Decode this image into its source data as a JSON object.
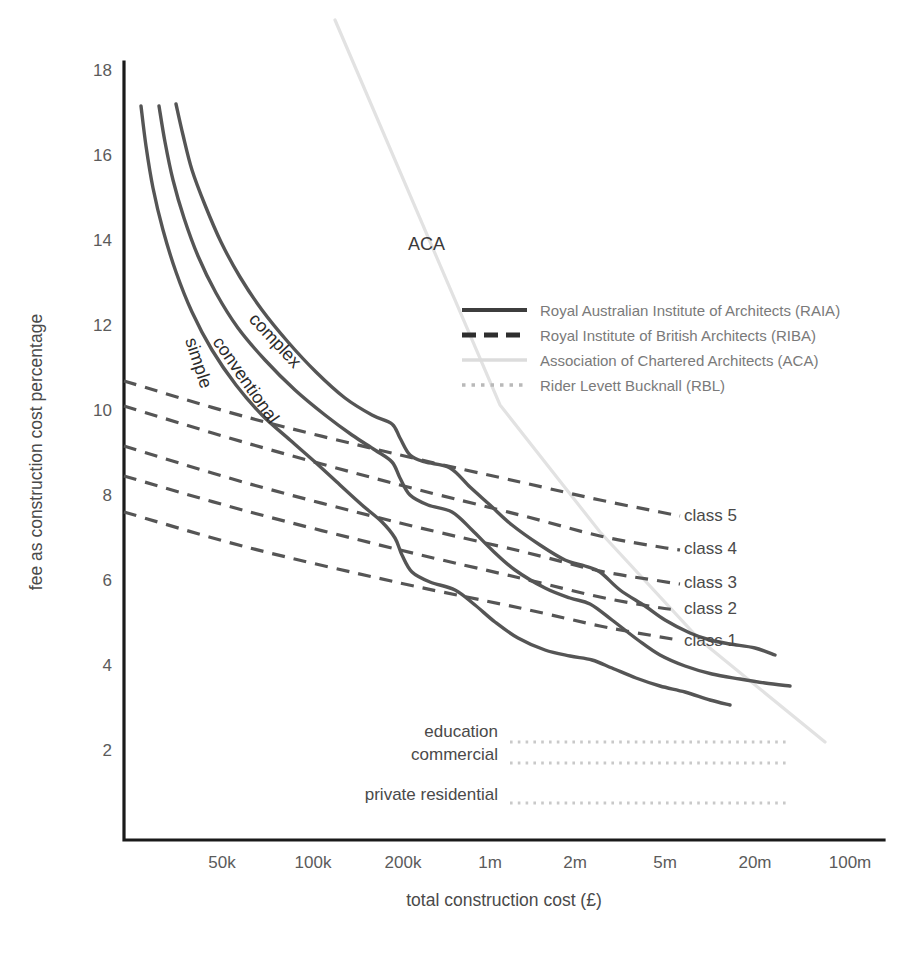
{
  "chart_data": {
    "type": "line",
    "title": "",
    "xlabel": "total construction cost (£)",
    "ylabel": "fee as construction cost percentage",
    "xscale": "log",
    "grid": false,
    "legend_position": "upper-right-inside",
    "xticks": [
      "50k",
      "100k",
      "200k",
      "1m",
      "2m",
      "5m",
      "20m",
      "100m"
    ],
    "xtick_values": [
      50000,
      100000,
      200000,
      1000000,
      2000000,
      5000000,
      20000000,
      100000000
    ],
    "xtick_px": [
      222,
      313,
      403,
      490,
      575,
      665,
      755,
      850
    ],
    "yticks": [
      2,
      4,
      6,
      8,
      10,
      12,
      14,
      16,
      18
    ],
    "ylim": [
      1.1,
      18.5
    ],
    "series": [
      {
        "name": "complex",
        "group": "RAIA",
        "style": "solid",
        "label": "complex",
        "label_px": {
          "x": 248,
          "y": 320,
          "rotate": 47
        },
        "points_px": [
          [
            176,
            104
          ],
          [
            183,
            135
          ],
          [
            192,
            170
          ],
          [
            205,
            205
          ],
          [
            221,
            242
          ],
          [
            240,
            277
          ],
          [
            262,
            310
          ],
          [
            288,
            342
          ],
          [
            316,
            372
          ],
          [
            345,
            398
          ],
          [
            372,
            415
          ],
          [
            392,
            424
          ],
          [
            400,
            438
          ],
          [
            410,
            455
          ],
          [
            425,
            462
          ],
          [
            450,
            468
          ],
          [
            470,
            487
          ],
          [
            490,
            505
          ],
          [
            512,
            525
          ],
          [
            540,
            545
          ],
          [
            565,
            560
          ],
          [
            585,
            566
          ],
          [
            600,
            572
          ],
          [
            620,
            590
          ],
          [
            645,
            606
          ],
          [
            665,
            620
          ],
          [
            690,
            633
          ],
          [
            710,
            640
          ],
          [
            730,
            644
          ],
          [
            755,
            648
          ],
          [
            775,
            655
          ]
        ]
      },
      {
        "name": "conventional",
        "group": "RAIA",
        "style": "solid",
        "label": "conventional",
        "label_px": {
          "x": 212,
          "y": 342,
          "rotate": 55
        },
        "points_px": [
          [
            159,
            106
          ],
          [
            165,
            142
          ],
          [
            173,
            180
          ],
          [
            184,
            218
          ],
          [
            198,
            256
          ],
          [
            216,
            293
          ],
          [
            238,
            328
          ],
          [
            265,
            360
          ],
          [
            295,
            390
          ],
          [
            325,
            415
          ],
          [
            352,
            435
          ],
          [
            375,
            450
          ],
          [
            392,
            462
          ],
          [
            400,
            478
          ],
          [
            410,
            495
          ],
          [
            428,
            505
          ],
          [
            452,
            512
          ],
          [
            472,
            530
          ],
          [
            492,
            550
          ],
          [
            515,
            570
          ],
          [
            545,
            588
          ],
          [
            570,
            598
          ],
          [
            590,
            604
          ],
          [
            612,
            620
          ],
          [
            638,
            640
          ],
          [
            660,
            655
          ],
          [
            685,
            666
          ],
          [
            712,
            674
          ],
          [
            740,
            679
          ],
          [
            765,
            683
          ],
          [
            790,
            686
          ]
        ]
      },
      {
        "name": "simple",
        "group": "RAIA",
        "style": "solid",
        "label": "simple",
        "label_px": {
          "x": 185,
          "y": 340,
          "rotate": 72
        },
        "points_px": [
          [
            141,
            106
          ],
          [
            146,
            146
          ],
          [
            153,
            188
          ],
          [
            163,
            230
          ],
          [
            176,
            272
          ],
          [
            192,
            312
          ],
          [
            212,
            350
          ],
          [
            236,
            385
          ],
          [
            262,
            415
          ],
          [
            290,
            440
          ],
          [
            315,
            462
          ],
          [
            340,
            485
          ],
          [
            362,
            505
          ],
          [
            382,
            522
          ],
          [
            395,
            538
          ],
          [
            402,
            555
          ],
          [
            412,
            572
          ],
          [
            430,
            582
          ],
          [
            455,
            590
          ],
          [
            475,
            605
          ],
          [
            495,
            622
          ],
          [
            518,
            638
          ],
          [
            545,
            650
          ],
          [
            570,
            656
          ],
          [
            592,
            660
          ],
          [
            612,
            668
          ],
          [
            636,
            678
          ],
          [
            660,
            686
          ],
          [
            685,
            692
          ],
          [
            710,
            700
          ],
          [
            730,
            705
          ]
        ]
      },
      {
        "name": "class 5",
        "group": "RIBA",
        "style": "dashed",
        "label": "class 5",
        "label_px": {
          "x": 684,
          "y": 521
        },
        "points_px": [
          [
            124,
            381
          ],
          [
            250,
            418
          ],
          [
            400,
            455
          ],
          [
            520,
            482
          ],
          [
            600,
            500
          ],
          [
            660,
            512
          ],
          [
            680,
            516
          ]
        ]
      },
      {
        "name": "class 4",
        "group": "RIBA",
        "style": "dashed",
        "label": "class 4",
        "label_px": {
          "x": 684,
          "y": 554
        },
        "points_px": [
          [
            124,
            406
          ],
          [
            250,
            444
          ],
          [
            400,
            485
          ],
          [
            520,
            515
          ],
          [
            600,
            536
          ],
          [
            660,
            547
          ],
          [
            680,
            550
          ]
        ]
      },
      {
        "name": "class 3",
        "group": "RIBA",
        "style": "dashed",
        "label": "class 3",
        "label_px": {
          "x": 684,
          "y": 588
        },
        "points_px": [
          [
            124,
            446
          ],
          [
            250,
            484
          ],
          [
            400,
            523
          ],
          [
            520,
            551
          ],
          [
            600,
            571
          ],
          [
            660,
            581
          ],
          [
            680,
            584
          ]
        ]
      },
      {
        "name": "class 2",
        "group": "RIBA",
        "style": "dashed",
        "label": "class 2",
        "label_px": {
          "x": 684,
          "y": 614
        },
        "points_px": [
          [
            124,
            476
          ],
          [
            250,
            512
          ],
          [
            400,
            550
          ],
          [
            520,
            578
          ],
          [
            600,
            597
          ],
          [
            655,
            607
          ],
          [
            678,
            610
          ]
        ]
      },
      {
        "name": "class 1",
        "group": "RIBA",
        "style": "dashed",
        "label": "class 1",
        "label_px": {
          "x": 684,
          "y": 646
        },
        "points_px": [
          [
            124,
            512
          ],
          [
            250,
            548
          ],
          [
            400,
            583
          ],
          [
            520,
            608
          ],
          [
            600,
            626
          ],
          [
            655,
            636
          ],
          [
            678,
            640
          ]
        ]
      },
      {
        "name": "ACA",
        "group": "ACA",
        "style": "solid-light",
        "label": "ACA",
        "label_px": {
          "x": 408,
          "y": 250
        },
        "points_px": [
          [
            335,
            20
          ],
          [
            500,
            405
          ],
          [
            600,
            532
          ],
          [
            700,
            640
          ],
          [
            825,
            742
          ]
        ]
      },
      {
        "name": "education",
        "group": "RBL",
        "style": "dotted",
        "label": "education",
        "label_px": {
          "x": 498,
          "y": 737
        },
        "value": 3.3,
        "points_px": [
          [
            510,
            742
          ],
          [
            790,
            742
          ]
        ]
      },
      {
        "name": "commercial",
        "group": "RBL",
        "style": "dotted",
        "label": "commercial",
        "label_px": {
          "x": 498,
          "y": 760
        },
        "value": 2.85,
        "points_px": [
          [
            510,
            763
          ],
          [
            790,
            763
          ]
        ]
      },
      {
        "name": "private residential",
        "group": "RBL",
        "style": "dotted",
        "label": "private residential",
        "label_px": {
          "x": 498,
          "y": 800
        },
        "value": 1.9,
        "points_px": [
          [
            510,
            803
          ],
          [
            790,
            803
          ]
        ]
      }
    ],
    "legend": [
      {
        "key": "raia",
        "label": "Royal Australian Institute of Architects (RAIA)"
      },
      {
        "key": "riba",
        "label": "Royal Institute of British Architects (RIBA)"
      },
      {
        "key": "aca",
        "label": "Association of Chartered Architects (ACA)"
      },
      {
        "key": "rbl",
        "label": "Rider Levett Bucknall (RBL)"
      }
    ],
    "colors": {
      "raia": "#555555",
      "riba": "#555555",
      "aca": "#e2e2e2",
      "rbl": "#c9c9c9",
      "axis": "#1a1a1a",
      "text": "#4a4a4a"
    }
  }
}
